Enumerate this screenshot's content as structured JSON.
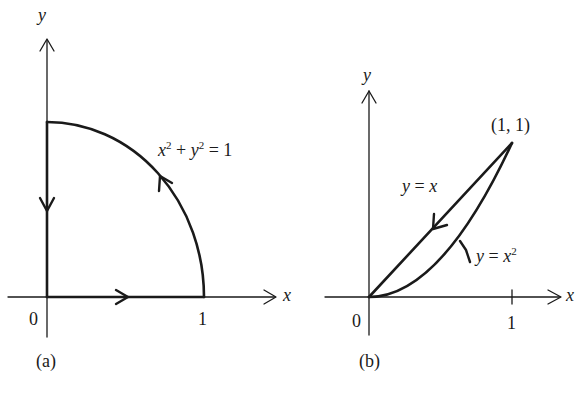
{
  "panels": [
    {
      "id": "a",
      "caption": "(a)",
      "axis_x_label": "x",
      "axis_y_label": "y",
      "origin_label": "0",
      "tick_x_label": "1",
      "curve_label": {
        "lhs_x": "x",
        "exp1": "2",
        "plus": " + ",
        "lhs_y": "y",
        "exp2": "2",
        "rhs": " = 1"
      },
      "path": [
        "segment (0,0)→(1,0)",
        "arc x^2+y^2=1 from (1,0) to (0,1)",
        "segment (0,1)→(0,0)"
      ]
    },
    {
      "id": "b",
      "caption": "(b)",
      "axis_x_label": "x",
      "axis_y_label": "y",
      "origin_label": "0",
      "tick_x_label": "1",
      "point_label": "(1, 1)",
      "line_label": {
        "y": "y",
        "eq": " = ",
        "x": "x"
      },
      "parabola_label": {
        "y": "y",
        "eq": " = ",
        "x": "x",
        "exp": "2"
      },
      "path": [
        "curve y=x^2 from (0,0) to (1,1)",
        "line y=x from (1,1) to (0,0)"
      ]
    }
  ],
  "colors": {
    "ink": "#1a1a1a",
    "background": "#ffffff"
  }
}
